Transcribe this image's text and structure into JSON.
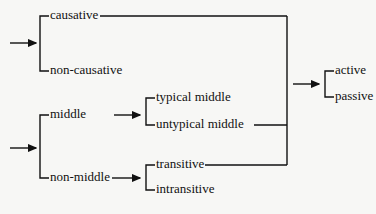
{
  "diagram": {
    "type": "system-network",
    "colors": {
      "line": "#111111",
      "background": "#f7f7f5"
    },
    "systems": [
      {
        "id": "causativity",
        "options": [
          "causative",
          "non-causative"
        ]
      },
      {
        "id": "middle",
        "options": [
          "middle",
          "non-middle"
        ]
      },
      {
        "id": "middle-type",
        "entry": "middle",
        "options": [
          "typical middle",
          "untypical middle"
        ]
      },
      {
        "id": "transitivity",
        "entry": "non-middle",
        "options": [
          "transitive",
          "intransitive"
        ]
      },
      {
        "id": "voice",
        "entry_conjunction": [
          "causative",
          "untypical middle",
          "transitive"
        ],
        "options": [
          "active",
          "passive"
        ]
      }
    ],
    "labels": {
      "causative": "causative",
      "non_causative": "non-causative",
      "middle": "middle",
      "non_middle": "non-middle",
      "typical_middle": "typical middle",
      "untypical_middle": "untypical middle",
      "transitive": "transitive",
      "intransitive": "intransitive",
      "active": "active",
      "passive": "passive"
    }
  }
}
